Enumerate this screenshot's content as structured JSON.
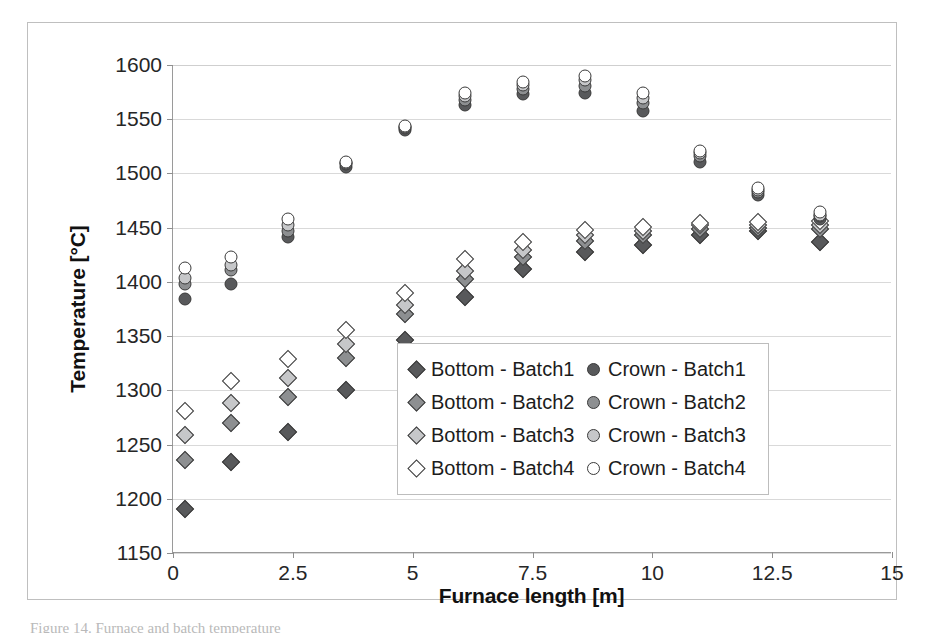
{
  "chart_data": {
    "type": "scatter",
    "title": "",
    "xlabel": "Furnace length [m]",
    "ylabel": "Temperature [°C]",
    "xlim": [
      0,
      15
    ],
    "ylim": [
      1150,
      1600
    ],
    "xticks": [
      "0",
      "2.5",
      "5",
      "7.5",
      "10",
      "12.5",
      "15"
    ],
    "xtick_values": [
      0,
      2.5,
      5,
      7.5,
      10,
      12.5,
      15
    ],
    "yticks": [
      "1150",
      "1200",
      "1250",
      "1300",
      "1350",
      "1400",
      "1450",
      "1500",
      "1550",
      "1600"
    ],
    "ytick_values": [
      1150,
      1200,
      1250,
      1300,
      1350,
      1400,
      1450,
      1500,
      1550,
      1600
    ],
    "grid": "horizontal",
    "legend_position": "center-right-inside",
    "x": [
      0.25,
      1.2,
      2.4,
      3.6,
      4.85,
      6.1,
      7.3,
      8.6,
      9.8,
      11.0,
      12.2,
      13.5
    ],
    "series": [
      {
        "name": "Bottom - Batch1",
        "marker": "diamond",
        "fill": "#58595b",
        "values": [
          1191,
          1234,
          1262,
          1300,
          1346,
          1386,
          1412,
          1428,
          1434,
          1443,
          1447,
          1437
        ]
      },
      {
        "name": "Bottom - Batch2",
        "marker": "diamond",
        "fill": "#8d8f91",
        "values": [
          1236,
          1270,
          1294,
          1330,
          1370,
          1403,
          1423,
          1438,
          1443,
          1449,
          1450,
          1449
        ]
      },
      {
        "name": "Bottom - Batch3",
        "marker": "diamond",
        "fill": "#c6c7c9",
        "values": [
          1259,
          1288,
          1311,
          1343,
          1379,
          1410,
          1429,
          1443,
          1447,
          1452,
          1452,
          1452
        ]
      },
      {
        "name": "Bottom - Batch4",
        "marker": "diamond",
        "fill": "#ffffff",
        "values": [
          1281,
          1309,
          1329,
          1356,
          1390,
          1421,
          1437,
          1448,
          1451,
          1454,
          1455,
          1456
        ]
      },
      {
        "name": "Crown - Batch1",
        "marker": "circle",
        "fill": "#58595b",
        "values": [
          1384,
          1398,
          1441,
          1506,
          1540,
          1563,
          1573,
          1574,
          1558,
          1511,
          1480,
          1458
        ]
      },
      {
        "name": "Crown - Batch2",
        "marker": "circle",
        "fill": "#8d8f91",
        "values": [
          1398,
          1411,
          1447,
          1509,
          1542,
          1568,
          1578,
          1581,
          1565,
          1516,
          1483,
          1461
        ]
      },
      {
        "name": "Crown - Batch3",
        "marker": "circle",
        "fill": "#c6c7c9",
        "values": [
          1404,
          1416,
          1452,
          1510,
          1543,
          1571,
          1582,
          1586,
          1570,
          1519,
          1485,
          1462
        ]
      },
      {
        "name": "Crown - Batch4",
        "marker": "circle",
        "fill": "#ffffff",
        "values": [
          1413,
          1423,
          1458,
          1511,
          1544,
          1574,
          1584,
          1590,
          1574,
          1521,
          1487,
          1464
        ]
      }
    ]
  },
  "legend": {
    "entries": [
      {
        "label": "Bottom - Batch1",
        "marker": "diamond",
        "fill": "#58595b"
      },
      {
        "label": "Crown - Batch1",
        "marker": "circle",
        "fill": "#58595b"
      },
      {
        "label": "Bottom - Batch2",
        "marker": "diamond",
        "fill": "#8d8f91"
      },
      {
        "label": "Crown - Batch2",
        "marker": "circle",
        "fill": "#8d8f91"
      },
      {
        "label": "Bottom - Batch3",
        "marker": "diamond",
        "fill": "#c6c7c9"
      },
      {
        "label": "Crown - Batch3",
        "marker": "circle",
        "fill": "#c6c7c9"
      },
      {
        "label": "Bottom - Batch4",
        "marker": "diamond",
        "fill": "#ffffff"
      },
      {
        "label": "Crown - Batch4",
        "marker": "circle",
        "fill": "#ffffff"
      }
    ]
  },
  "caption": {
    "text": "Figure 14. Furnace and batch temperature"
  }
}
